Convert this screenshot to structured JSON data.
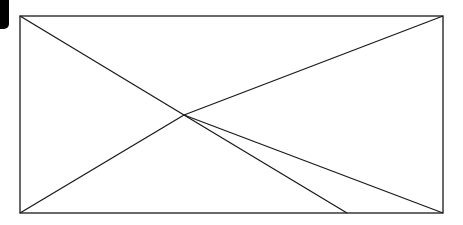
{
  "diagram": {
    "type": "image-placeholder",
    "stroke_color": "#1a1a1a",
    "background": "#ffffff",
    "frame": {
      "x1": 20,
      "y1": 16,
      "x2": 443,
      "y2": 213
    },
    "center_point": {
      "x": 184,
      "y": 115
    },
    "lines": [
      {
        "id": "top-left-to-center",
        "x1": 20,
        "y1": 16,
        "x2": 184,
        "y2": 115
      },
      {
        "id": "center-to-bottom-mid",
        "x1": 184,
        "y1": 115,
        "x2": 347,
        "y2": 213
      },
      {
        "id": "bottom-left-to-center",
        "x1": 20,
        "y1": 213,
        "x2": 184,
        "y2": 115
      },
      {
        "id": "center-to-top-right",
        "x1": 184,
        "y1": 115,
        "x2": 443,
        "y2": 16
      },
      {
        "id": "center-to-bottom-right",
        "x1": 184,
        "y1": 115,
        "x2": 443,
        "y2": 213
      }
    ],
    "corner_tab": {
      "color": "#000000"
    }
  }
}
